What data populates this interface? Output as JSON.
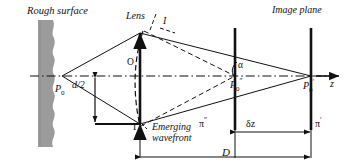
{
  "figure": {
    "type": "optics-ray-diagram",
    "width": 348,
    "height": 166,
    "background": "#ffffff",
    "ink": "#111111",
    "surface_fill": "#9b9b9b"
  },
  "labels": {
    "rough_surface": "Rough surface",
    "lens": "Lens",
    "image_plane": "Image plane",
    "point_I": "I",
    "lens_center_O": "O",
    "source_P0": "P",
    "source_P0_sub": "0",
    "half_aperture": "d/2",
    "gamma": "Γ",
    "emerging_line1": "Emerging",
    "emerging_line2": "wavefront",
    "alpha": "α",
    "p0_double_prime": "P",
    "p0_double_prime_sub": "0",
    "p0_double_prime_sup": "″",
    "p0_prime": "P",
    "p0_prime_sub": "0",
    "p0_prime_sup": "′",
    "axis_z": "z",
    "pi_double_prime": "π",
    "pi_double_prime_sup": "″",
    "pi_prime": "π",
    "pi_prime_sup": "′",
    "delta_z": "δz",
    "distance_D": "D"
  },
  "geometry": {
    "optical_axis_y": 76,
    "source_x": 62,
    "lens_x": 140,
    "lens_top_y": 33,
    "lens_bottom_y": 124,
    "plane_pi2_x": 235,
    "plane_pi1_x": 311,
    "rough_surface_x": 38,
    "rough_surface_width": 18
  }
}
